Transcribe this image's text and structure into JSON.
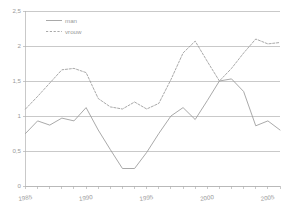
{
  "chart_data": {
    "type": "line",
    "title": "",
    "xlabel": "",
    "ylabel": "",
    "xlim": [
      1985,
      2006
    ],
    "ylim": [
      0,
      2.5
    ],
    "grid": true,
    "legend_position": "top-left-inside",
    "y_ticks": [
      "0",
      "0,5",
      "1",
      "1,5",
      "2",
      "2,5"
    ],
    "y_tick_values": [
      0,
      0.5,
      1,
      1.5,
      2,
      2.5
    ],
    "x_ticks": [
      "1985",
      "1990",
      "1995",
      "2000",
      "2005"
    ],
    "x_tick_values": [
      1985,
      1990,
      1995,
      2000,
      2005
    ],
    "x": [
      1985,
      1986,
      1987,
      1988,
      1989,
      1990,
      1991,
      1992,
      1993,
      1994,
      1995,
      1996,
      1997,
      1998,
      1999,
      2000,
      2001,
      2002,
      2003,
      2004,
      2005,
      2006
    ],
    "series": [
      {
        "name": "man",
        "style": "solid",
        "color": "#9a9a9a",
        "values": [
          0.75,
          0.93,
          0.87,
          0.97,
          0.93,
          1.12,
          0.8,
          0.52,
          0.25,
          0.25,
          0.48,
          0.75,
          1.0,
          1.12,
          0.95,
          1.22,
          1.5,
          1.53,
          1.35,
          0.86,
          0.93,
          0.8
        ]
      },
      {
        "name": "vrouw",
        "style": "dashed",
        "color": "#9a9a9a",
        "values": [
          1.1,
          1.28,
          1.47,
          1.66,
          1.68,
          1.62,
          1.25,
          1.13,
          1.1,
          1.2,
          1.1,
          1.18,
          1.52,
          1.9,
          2.07,
          1.78,
          1.5,
          1.68,
          1.9,
          2.1,
          2.03,
          2.05
        ]
      }
    ]
  },
  "legend": {
    "items": [
      {
        "label": "man"
      },
      {
        "label": "vrouw"
      }
    ]
  }
}
